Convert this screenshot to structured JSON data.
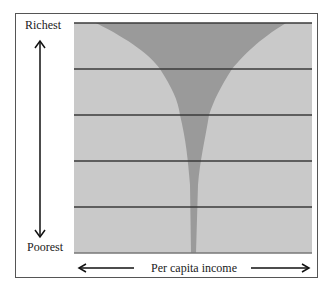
{
  "diagram": {
    "y_axis": {
      "top_label": "Richest",
      "bottom_label": "Poorest"
    },
    "x_axis": {
      "label": "Per capita income"
    },
    "bands": 5,
    "colors": {
      "background_fill": "#c9c9c9",
      "distribution_fill": "#9a9a9a",
      "band_lines": "#3a3a3a",
      "frame": "#555555",
      "arrows": "#111111"
    }
  }
}
